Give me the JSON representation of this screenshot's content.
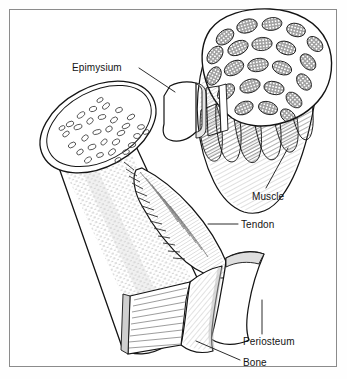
{
  "figure": {
    "background_color": "#ffffff",
    "frame_color": "#8b8b8b",
    "ink_color": "#141414",
    "shade_color": "#9a9a9a"
  },
  "labels": {
    "epimysium": "Epimysium",
    "muscle": "Muscle",
    "tendon": "Tendon",
    "periosteum": "Periosteum",
    "bone": "Bone"
  },
  "structures": {
    "bone_shaft": "bone-shaft",
    "bone_cross_section": "bone-cross-section",
    "osteons": "osteon-markings",
    "muscle_belly": "muscle-belly",
    "muscle_cross_section": "muscle-cross-section",
    "fascicles": "muscle-fascicles",
    "epimysium_flap": "epimysium-flap",
    "tendon_band": "tendon-band",
    "periosteum_flap": "periosteum-flap"
  },
  "counts": {
    "fascicles_in_cross_section": 22,
    "osteons_in_bone_section": 46
  }
}
